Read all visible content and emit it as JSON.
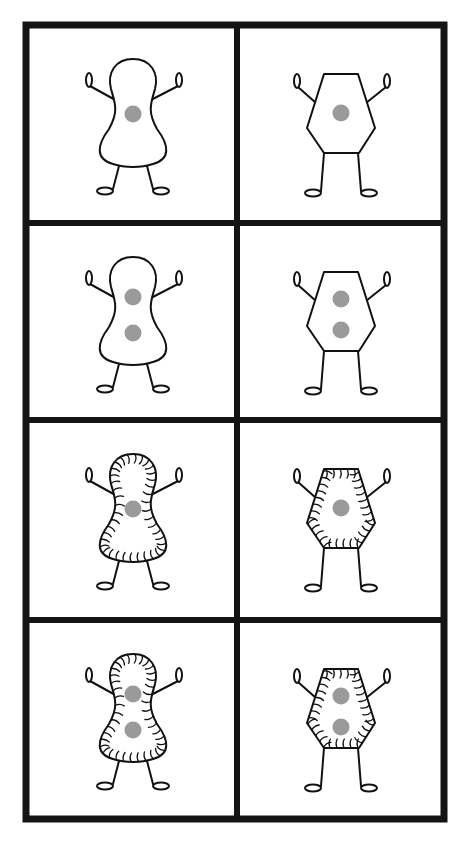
{
  "figure": {
    "layout": {
      "rows": 4,
      "cols": 2
    },
    "colors": {
      "border": "#141414",
      "nucleus": "#9a9a9a",
      "outline": "#111111",
      "background": "#ffffff"
    },
    "cells": [
      {
        "row": 1,
        "col": 1,
        "body_shape": "rounded-peanut",
        "nuclei": 1,
        "hairs": false
      },
      {
        "row": 1,
        "col": 2,
        "body_shape": "hexagon",
        "nuclei": 1,
        "hairs": false
      },
      {
        "row": 2,
        "col": 1,
        "body_shape": "rounded-peanut",
        "nuclei": 2,
        "hairs": false
      },
      {
        "row": 2,
        "col": 2,
        "body_shape": "hexagon",
        "nuclei": 2,
        "hairs": false
      },
      {
        "row": 3,
        "col": 1,
        "body_shape": "rounded-peanut",
        "nuclei": 1,
        "hairs": true
      },
      {
        "row": 3,
        "col": 2,
        "body_shape": "hexagon",
        "nuclei": 1,
        "hairs": true
      },
      {
        "row": 4,
        "col": 1,
        "body_shape": "rounded-peanut",
        "nuclei": 2,
        "hairs": true
      },
      {
        "row": 4,
        "col": 2,
        "body_shape": "hexagon",
        "nuclei": 2,
        "hairs": true
      }
    ]
  }
}
